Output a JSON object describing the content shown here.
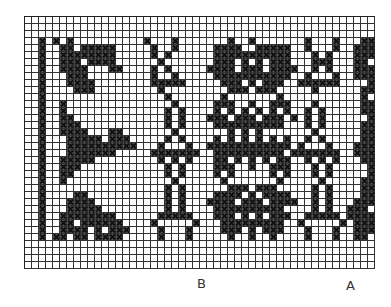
{
  "chart": {
    "cols": 50,
    "rows": [
      "..................................................",
      "..................................................",
      "..................................................",
      "..x.x.x..........x...x.......x..x.......x...x...xx",
      "..x..xx.xxxxx.....x..x.....xxxx..xxxxx..x...x..xxx",
      "..x..xxxxxxxx.....x.x......xxxxxxxxxxx...x.x...xxx",
      "..x..xxx.xxxx......x.......xxx.x.x.xxx...xxx...xx.",
      "..x..xxxx...xx....x.x.....xxxx.xxx.xxxx..x.x...xxx",
      "..x...xxx.........x..x.....xxxxxxxxxxx..x...x..xxx",
      "..x...xxxx........xxxxx.....xxx.x.xxx..xxxxxx....x",
      "..x....xxx.........x.........xxx.xxx.....x......xx",
      "..x.................x.......x.......x...........x.",
      "..x..x...............x.....xxx..x..xxx...x......xx",
      "..x..x..............x.x....x.x.x.x.x.x..x.x.....xx",
      "..x..xx.............x.x...xxx.xxx.xxx.x.x.x......x",
      "..x..xxx............x.x....xxxxxxxxxx...x.x.....xx",
      "..x..xxxx...xx.......x.......x.x.x.......x......xx",
      "..x...xxxxx.xxx.....x.x....x.x.x.x.x.x..x.x.....xx",
      "..x...xxxxxxxxxx...x...x..xxxxxxxxxxxx.x...x...xxx",
      "..x...xxxxxxx.....xxxxxxx..xxxxxxxxxx.xxxxxxx..xxx",
      "..x..xxxxx.........x.x.x...xx.x.x.x.xx..x.x.x...xx",
      "..x..xxx............x.x....xxx..x..xxx...x.x.....x",
      "..x..xx.............x.x....x.x.....x.x...x.x.....x",
      "..x..x...............x......x.......x.....x.....xx",
      "..x.................x.x......xxx.xxx.....x.x....xx",
      "..x....xx...........x.x....xxxx.x.xxxx...x.x....xx",
      "..x...xxxx..........x.x...xxxx.xxx.xxxx..x.x...xxx",
      "..x...xxxxx.........x.x....xxxxxxxxxx....x.x..xxx.",
      "..x..xxxxxxxx......xxxxx...xxx.x.x.xxx..xxxxx.xxxx",
      "..x..xx.xxxxxx....x.....x...xxxxxxxxx..x.....x.xxx",
      "..x..xxxx.x.xxx....x...x....xxx.x.xxx...x...x..xxx",
      "..x.xx.xx.xxxx.....x...x.....x..x..x....x...x..xx.",
      "..................................................",
      "..................................................",
      "..................................................",
      ".................................................."
    ]
  },
  "labels": {
    "b": "B",
    "a": "A"
  }
}
